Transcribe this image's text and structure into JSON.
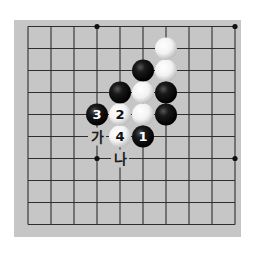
{
  "diagram": {
    "type": "go-board-fragment",
    "board": {
      "columns": 10,
      "rows": 10,
      "origin_x": 28,
      "origin_y": 26.5,
      "spacing_x": 23,
      "spacing_y": 22,
      "background_color": "#c6c6c6",
      "line_color": "#2e2e2e"
    },
    "star_points": [
      {
        "col": 3,
        "row": 0
      },
      {
        "col": 9,
        "row": 0
      },
      {
        "col": 3,
        "row": 6
      },
      {
        "col": 9,
        "row": 6
      }
    ],
    "stones": [
      {
        "color": "white",
        "col": 6,
        "row": 1,
        "label": ""
      },
      {
        "color": "black",
        "col": 5,
        "row": 2,
        "label": ""
      },
      {
        "color": "white",
        "col": 6,
        "row": 2,
        "label": ""
      },
      {
        "color": "black",
        "col": 4,
        "row": 3,
        "label": ""
      },
      {
        "color": "white",
        "col": 5,
        "row": 3,
        "label": ""
      },
      {
        "color": "black",
        "col": 6,
        "row": 3,
        "label": ""
      },
      {
        "color": "black",
        "col": 3,
        "row": 4,
        "label": "3"
      },
      {
        "color": "white",
        "col": 4,
        "row": 4,
        "label": "2"
      },
      {
        "color": "white",
        "col": 5,
        "row": 4,
        "label": ""
      },
      {
        "color": "black",
        "col": 6,
        "row": 4,
        "label": ""
      },
      {
        "color": "white",
        "col": 4,
        "row": 5,
        "label": "4"
      },
      {
        "color": "black",
        "col": 5,
        "row": 5,
        "label": "1"
      }
    ],
    "marks": [
      {
        "text": "가",
        "col": 3,
        "row": 5
      },
      {
        "text": "나",
        "col": 4,
        "row": 6
      }
    ]
  }
}
